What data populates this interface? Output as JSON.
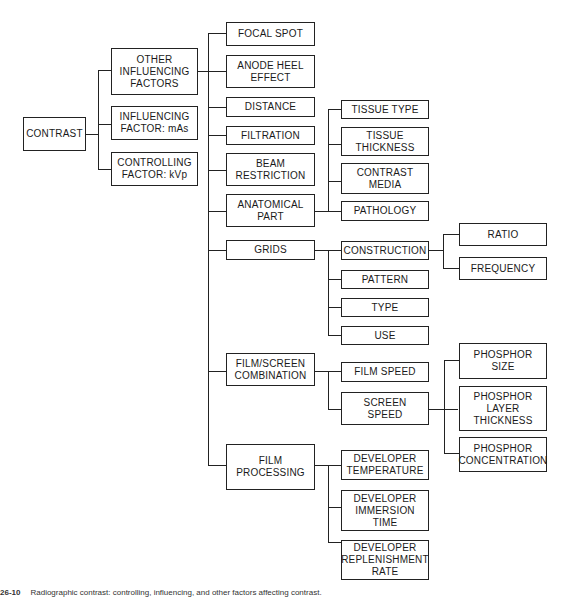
{
  "diagram": {
    "type": "tree",
    "root": "CONTRAST",
    "level1": [
      {
        "id": "other",
        "label": "OTHER\nINFLUENCING\nFACTORS"
      },
      {
        "id": "mas",
        "label": "INFLUENCING\nFACTOR: mAs"
      },
      {
        "id": "kvp",
        "label": "CONTROLLING\nFACTOR:  kVp"
      }
    ],
    "level2": [
      {
        "id": "focal",
        "label": "FOCAL  SPOT"
      },
      {
        "id": "anode",
        "label": "ANODE  HEEL\nEFFECT"
      },
      {
        "id": "distance",
        "label": "DISTANCE"
      },
      {
        "id": "filtration",
        "label": "FILTRATION"
      },
      {
        "id": "beam",
        "label": "BEAM\nRESTRICTION"
      },
      {
        "id": "anatomical",
        "label": "ANATOMICAL\nPART"
      },
      {
        "id": "grids",
        "label": "GRIDS"
      },
      {
        "id": "filmscreen",
        "label": "FILM/SCREEN\nCOMBINATION"
      },
      {
        "id": "filmproc",
        "label": "FILM\nPROCESSING"
      }
    ],
    "anatomical_children": [
      {
        "id": "tissuetype",
        "label": "TISSUE  TYPE"
      },
      {
        "id": "tissuethick",
        "label": "TISSUE\nTHICKNESS"
      },
      {
        "id": "contrastmedia",
        "label": "CONTRAST\nMEDIA"
      },
      {
        "id": "pathology",
        "label": "PATHOLOGY"
      }
    ],
    "grids_children": [
      {
        "id": "construction",
        "label": "CONSTRUCTION"
      },
      {
        "id": "pattern",
        "label": "PATTERN"
      },
      {
        "id": "type",
        "label": "TYPE"
      },
      {
        "id": "use",
        "label": "USE"
      }
    ],
    "construction_children": [
      {
        "id": "ratio",
        "label": "RATIO"
      },
      {
        "id": "frequency",
        "label": "FREQUENCY"
      }
    ],
    "filmscreen_children": [
      {
        "id": "filmspeed",
        "label": "FILM  SPEED"
      },
      {
        "id": "screenspeed",
        "label": "SCREEN\nSPEED"
      }
    ],
    "screenspeed_children": [
      {
        "id": "phsize",
        "label": "PHOSPHOR\nSIZE"
      },
      {
        "id": "phlayer",
        "label": "PHOSPHOR\nLAYER\nTHICKNESS"
      },
      {
        "id": "phconc",
        "label": "PHOSPHOR\nCONCENTRATION"
      }
    ],
    "filmproc_children": [
      {
        "id": "devtemp",
        "label": "DEVELOPER\nTEMPERATURE"
      },
      {
        "id": "devimm",
        "label": "DEVELOPER\nIMMERSION\nTIME"
      },
      {
        "id": "devrep",
        "label": "DEVELOPER\nREPLENISHMENT\nRATE"
      }
    ]
  },
  "caption": {
    "figure_number": "26-10",
    "text": "Radiographic contrast: controlling, influencing, and other factors affecting contrast."
  }
}
